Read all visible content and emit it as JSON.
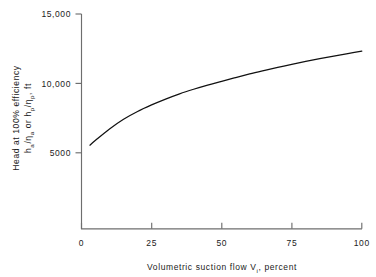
{
  "chart_data": {
    "type": "line",
    "title": "",
    "xlabel_parts": {
      "main": "Volumetric suction flow V",
      "subscript": "i",
      "tail": ", percent"
    },
    "xlabel": "Volumetric suction flow Vi , percent",
    "ylabel_line1": "Head at 100% efficiency",
    "ylabel_line2_parts": {
      "a": "h",
      "a_sub": "a",
      "slash1": "/",
      "eta1": "η",
      "eta1_sub": "a",
      "or": " or ",
      "b": "h",
      "b_sub": "p",
      "slash2": "/",
      "eta2": "η",
      "eta2_sub": "p",
      "tail": ", ft"
    },
    "ylabel_line2": "ha/ηa or hp/ηp, ft",
    "ylabel": "Head at 100% efficiency ha/ηa or hp/ηp, ft",
    "xticks": [
      0,
      25,
      50,
      75,
      100
    ],
    "xtick_labels": [
      "0",
      "25",
      "50",
      "75",
      "100"
    ],
    "yticks": [
      5000,
      10000,
      15000
    ],
    "ytick_labels": [
      "5000",
      "10,000",
      "15,000"
    ],
    "xlim": [
      0,
      100
    ],
    "ylim": [
      0,
      15000
    ],
    "grid": false,
    "legend": null,
    "series": [
      {
        "name": "Head at 100% efficiency",
        "x": [
          3,
          5,
          10,
          15,
          20,
          25,
          30,
          35,
          40,
          45,
          50,
          55,
          60,
          65,
          70,
          75,
          80,
          85,
          90,
          95,
          100
        ],
        "y": [
          5550,
          5900,
          6720,
          7420,
          7980,
          8450,
          8870,
          9250,
          9580,
          9880,
          10150,
          10420,
          10680,
          10920,
          11150,
          11370,
          11580,
          11780,
          11970,
          12150,
          12330
        ]
      }
    ],
    "colors": {
      "curve": "#111111",
      "axis": "#6e6e6e",
      "text": "#222222",
      "background": "#ffffff"
    }
  }
}
